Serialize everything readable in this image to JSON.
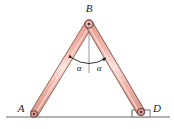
{
  "figure": {
    "kind": "statics-free-body-diagram",
    "background_color": "#ffffff"
  },
  "labels": {
    "apex": "B",
    "left_support": "A",
    "right_support": "D",
    "angle_left": "α",
    "angle_right": "α"
  },
  "colors": {
    "member_fill": "#f2b6ab",
    "member_highlight": "#f9d9d2",
    "member_outline": "#8a5c55",
    "joint_fill": "#a8716a",
    "joint_outline": "#5d3a35",
    "ground_line": "#9a9a9a",
    "centerline": "#8d8d8d",
    "arrow": "#1a1a1a",
    "text": "#1a1a1a"
  },
  "geometry": {
    "apex": {
      "x": 89,
      "y": 24
    },
    "left_support": {
      "x": 34,
      "y": 114
    },
    "right_support": {
      "x": 141,
      "y": 112
    },
    "ground_y": 117,
    "ground_x_start": 6,
    "ground_x_end": 170,
    "centerline_top_y": 28,
    "centerline_bottom_y": 72,
    "member_width": 7,
    "step_height": 6
  },
  "angle_markers": {
    "arc_radius": 33,
    "label_left_pos": {
      "x": 78,
      "y": 66
    },
    "label_right_pos": {
      "x": 98,
      "y": 66
    },
    "description": "two equal angles alpha measured from the vertical centerline to each member"
  }
}
